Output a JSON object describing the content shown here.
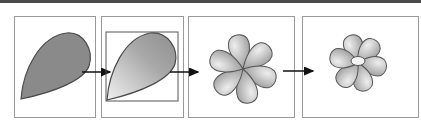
{
  "figure": {
    "steps": [
      {
        "id": 1,
        "name": "solid-petal",
        "fill": "#8a8a8a"
      },
      {
        "id": 2,
        "name": "gradient-petal-with-bounding-box"
      },
      {
        "id": 3,
        "name": "six-petal-flower"
      },
      {
        "id": 4,
        "name": "flower-with-center"
      }
    ],
    "colors": {
      "panel_border": "#9a9a9a",
      "outline": "#555555",
      "arrow": "#111111",
      "top_bar": "#4a4a4a",
      "gradient_light": "#eeeeee",
      "gradient_dark": "#8c8c8c"
    }
  }
}
